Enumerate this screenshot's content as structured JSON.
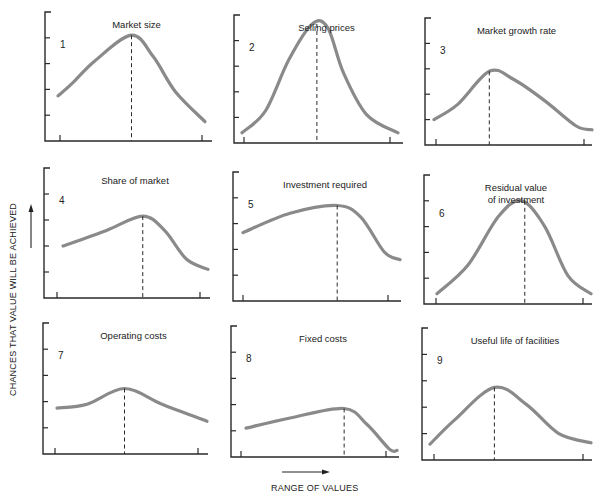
{
  "figure": {
    "ylabel": "CHANCES THAT VALUE WILL BE ACHIEVED",
    "xlabel": "RANGE OF VALUES"
  },
  "chart_data": [
    {
      "type": "line",
      "id": 1,
      "title": "Market size",
      "title_lines": [
        "Market size"
      ],
      "x": [
        0,
        0.1,
        0.25,
        0.5,
        0.65,
        0.8,
        1.0
      ],
      "y": [
        0.35,
        0.45,
        0.62,
        0.82,
        0.65,
        0.38,
        0.15
      ],
      "mode_x": 0.5,
      "ylim": [
        0,
        1
      ],
      "yticks": 5,
      "grid": false
    },
    {
      "type": "line",
      "id": 2,
      "title": "Selling prices",
      "title_lines": [
        "Selling prices"
      ],
      "x": [
        0,
        0.15,
        0.3,
        0.45,
        0.55,
        0.65,
        0.8,
        1.0
      ],
      "y": [
        0.08,
        0.25,
        0.65,
        0.93,
        0.9,
        0.55,
        0.22,
        0.08
      ],
      "mode_x": 0.48,
      "ylim": [
        0,
        1
      ],
      "yticks": 5,
      "grid": false
    },
    {
      "type": "line",
      "id": 3,
      "title": "Market growth rate",
      "title_lines": [
        "Market growth rate"
      ],
      "x": [
        0,
        0.15,
        0.35,
        0.5,
        0.7,
        0.9,
        1.0
      ],
      "y": [
        0.2,
        0.32,
        0.58,
        0.52,
        0.35,
        0.15,
        0.12
      ],
      "mode_x": 0.35,
      "ylim": [
        0,
        1
      ],
      "yticks": 5,
      "grid": false
    },
    {
      "type": "line",
      "id": 4,
      "title": "Share of market",
      "title_lines": [
        "Share of market"
      ],
      "x": [
        0,
        0.3,
        0.55,
        0.7,
        0.85,
        1.0
      ],
      "y": [
        0.4,
        0.52,
        0.63,
        0.52,
        0.3,
        0.22
      ],
      "mode_x": 0.55,
      "ylim": [
        0,
        1
      ],
      "yticks": 5,
      "grid": false
    },
    {
      "type": "line",
      "id": 5,
      "title": "Investment required",
      "title_lines": [
        "Investment required"
      ],
      "x": [
        0,
        0.3,
        0.6,
        0.75,
        0.9,
        1.0
      ],
      "y": [
        0.53,
        0.68,
        0.74,
        0.65,
        0.38,
        0.32
      ],
      "mode_x": 0.6,
      "ylim": [
        0,
        1
      ],
      "yticks": 5,
      "grid": false
    },
    {
      "type": "line",
      "id": 6,
      "title": "Residual value of investment",
      "title_lines": [
        "Residual value",
        "of investment"
      ],
      "x": [
        0,
        0.2,
        0.4,
        0.55,
        0.7,
        0.85,
        1.0
      ],
      "y": [
        0.08,
        0.3,
        0.68,
        0.8,
        0.6,
        0.22,
        0.08
      ],
      "mode_x": 0.57,
      "ylim": [
        0,
        1
      ],
      "yticks": 5,
      "grid": false
    },
    {
      "type": "line",
      "id": 7,
      "title": "Operating costs",
      "title_lines": [
        "Operating costs"
      ],
      "x": [
        0,
        0.2,
        0.45,
        0.7,
        1.0
      ],
      "y": [
        0.35,
        0.38,
        0.5,
        0.38,
        0.25
      ],
      "mode_x": 0.45,
      "ylim": [
        0,
        1
      ],
      "yticks": 5,
      "grid": false
    },
    {
      "type": "line",
      "id": 8,
      "title": "Fixed costs",
      "title_lines": [
        "Fixed costs"
      ],
      "x": [
        0,
        0.3,
        0.65,
        0.8,
        0.95,
        1.0
      ],
      "y": [
        0.22,
        0.3,
        0.37,
        0.25,
        0.06,
        0.05
      ],
      "mode_x": 0.65,
      "ylim": [
        0,
        1
      ],
      "yticks": 5,
      "grid": false
    },
    {
      "type": "line",
      "id": 9,
      "title": "Useful life of facilities",
      "title_lines": [
        "Useful life of facilities"
      ],
      "x": [
        0,
        0.15,
        0.4,
        0.6,
        0.8,
        1.0
      ],
      "y": [
        0.12,
        0.3,
        0.55,
        0.42,
        0.2,
        0.13
      ],
      "mode_x": 0.4,
      "ylim": [
        0,
        1
      ],
      "yticks": 5,
      "grid": false
    }
  ]
}
